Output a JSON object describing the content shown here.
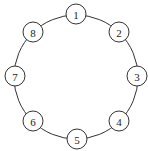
{
  "diagram": {
    "type": "ring-graph",
    "ring": {
      "cx": 76,
      "cy": 77,
      "r": 62
    },
    "node_radius": 10,
    "nodes": [
      {
        "label": "1",
        "cx": 76,
        "cy": 14
      },
      {
        "label": "2",
        "cx": 119,
        "cy": 32
      },
      {
        "label": "3",
        "cx": 137,
        "cy": 76
      },
      {
        "label": "4",
        "cx": 119,
        "cy": 121
      },
      {
        "label": "5",
        "cx": 77,
        "cy": 139
      },
      {
        "label": "6",
        "cx": 33,
        "cy": 121
      },
      {
        "label": "7",
        "cx": 15,
        "cy": 76
      },
      {
        "label": "8",
        "cx": 33,
        "cy": 32
      }
    ],
    "colors": {
      "stroke": "#333333",
      "fill": "#ffffff",
      "text": "#222222"
    }
  }
}
